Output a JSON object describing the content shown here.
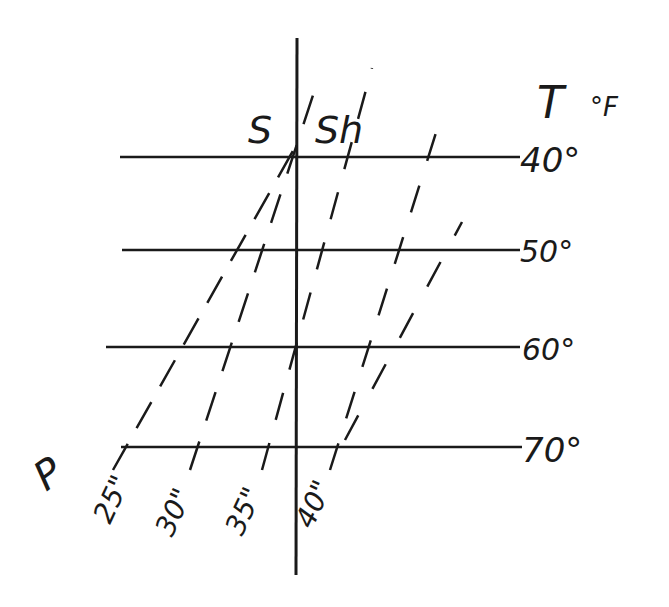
{
  "diagram": {
    "axis_title": "T",
    "axis_unit": "°F",
    "region_left_label": "S",
    "region_right_label": "Sh",
    "pressure_label": "P",
    "temperatures": [
      {
        "label": "40°",
        "y": 157
      },
      {
        "label": "50°",
        "y": 250
      },
      {
        "label": "60°",
        "y": 347
      },
      {
        "label": "70°",
        "y": 447
      }
    ],
    "pressures": [
      {
        "label": "25\"",
        "x0": 113,
        "y0": 470,
        "x1": 298,
        "y1": 140
      },
      {
        "label": "30\"",
        "x0": 190,
        "y0": 470,
        "x1": 440,
        "y1": 120
      },
      {
        "label": "35\"",
        "x0": 262,
        "y0": 470,
        "x1": 462,
        "y1": 220
      },
      {
        "label": "40\"",
        "x0": 330,
        "y0": 470,
        "x1": 350,
        "y1": 440
      }
    ],
    "colors": {
      "ink": "#1a1a1a",
      "paper": "#ffffff"
    }
  }
}
